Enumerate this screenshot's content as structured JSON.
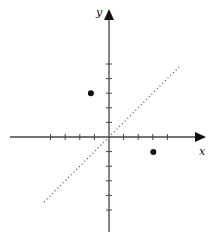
{
  "diagram": {
    "type": "coordinate-plane",
    "axes": {
      "x_label": "x",
      "y_label": "y",
      "x_ticks": [
        -4,
        -3,
        -2,
        -1,
        1,
        2,
        3,
        4
      ],
      "y_ticks": [
        5,
        4,
        3,
        2,
        1,
        -1,
        -2,
        -3,
        -4,
        -5
      ]
    },
    "points": [
      {
        "name": "point-upper-left",
        "x": -1,
        "y": 3
      },
      {
        "name": "point-lower-right",
        "x": 3,
        "y": -1
      }
    ],
    "line": {
      "style": "dotted",
      "equation": "y = x"
    },
    "colors": {
      "axis": "#444444",
      "point": "#111111",
      "line": "#555555"
    }
  }
}
